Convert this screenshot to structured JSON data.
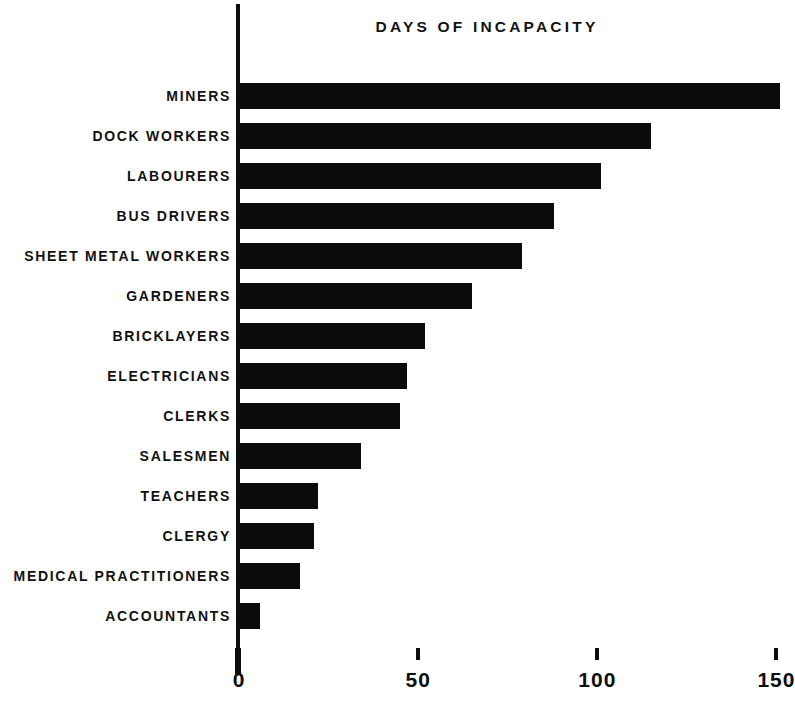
{
  "chart_data": {
    "type": "bar",
    "orientation": "horizontal",
    "title": "DAYS OF INCAPACITY",
    "xlabel": "",
    "ylabel": "",
    "xlim": [
      0,
      160
    ],
    "grid": false,
    "legend": null,
    "xticks": [
      {
        "value": 0,
        "label": "0"
      },
      {
        "value": 50,
        "label": "50"
      },
      {
        "value": 100,
        "label": "100"
      },
      {
        "value": 150,
        "label": "150"
      }
    ],
    "categories": [
      "MINERS",
      "DOCK WORKERS",
      "LABOURERS",
      "BUS DRIVERS",
      "SHEET METAL WORKERS",
      "GARDENERS",
      "BRICKLAYERS",
      "ELECTRICIANS",
      "CLERKS",
      "SALESMEN",
      "TEACHERS",
      "CLERGY",
      "MEDICAL PRACTITIONERS",
      "ACCOUNTANTS"
    ],
    "values": [
      151,
      115,
      101,
      88,
      79,
      65,
      52,
      47,
      45,
      34,
      22,
      21,
      17,
      6
    ],
    "bar_color": "#0b0b0b",
    "background_color": "#ffffff"
  }
}
